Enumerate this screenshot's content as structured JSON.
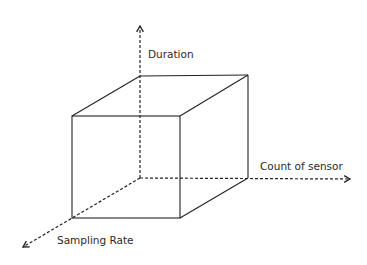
{
  "diagram": {
    "type": "3d-cube-axes",
    "axes": [
      {
        "id": "duration",
        "label": "Duration",
        "direction": "up"
      },
      {
        "id": "count-of-sensor",
        "label": "Count of sensor",
        "direction": "right"
      },
      {
        "id": "sampling-rate",
        "label": "Sampling Rate",
        "direction": "down-left"
      }
    ],
    "colors": {
      "line": "#222222",
      "text": "#2a2a2a",
      "background": "#ffffff"
    }
  }
}
